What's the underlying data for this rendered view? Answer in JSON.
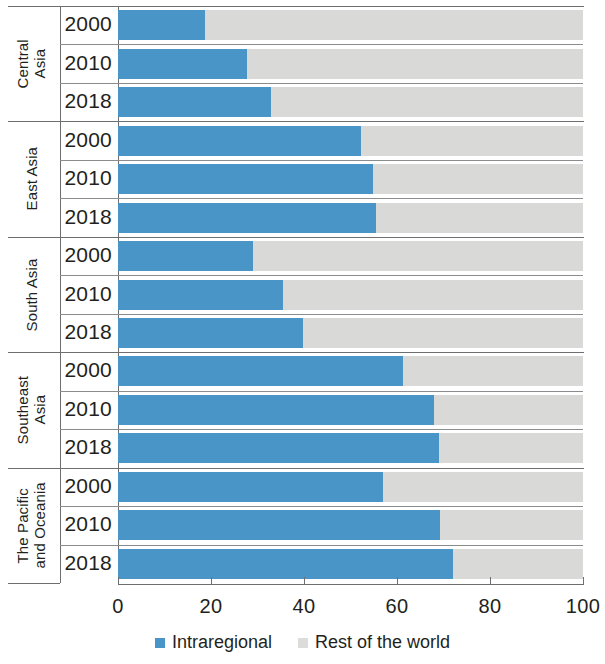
{
  "chart_data": {
    "type": "bar",
    "orientation": "horizontal",
    "stacked": true,
    "title": "",
    "xlabel": "",
    "ylabel": "",
    "xlim": [
      0,
      100
    ],
    "xticks": [
      0,
      20,
      40,
      60,
      80,
      100
    ],
    "xtick_labels": [
      "0",
      "20",
      "40",
      "60",
      "80",
      "100"
    ],
    "grid": false,
    "legend_position": "bottom-center",
    "legend": [
      "Intraregional",
      "Rest of the world"
    ],
    "colors": {
      "intraregional": "#4a95c8",
      "rest_of_the_world": "#d9d9d7",
      "axis": "#6d6e70",
      "text": "#231f20"
    },
    "series": [
      {
        "name": "Intraregional",
        "color": "#4a95c8"
      },
      {
        "name": "Rest of the world",
        "color": "#d9d9d7"
      }
    ],
    "groups": [
      {
        "label": "Central\nAsia",
        "label_plain": "Central Asia",
        "rows": [
          {
            "year": "2000",
            "intraregional": 18.7,
            "rest_of_the_world": 81.3
          },
          {
            "year": "2010",
            "intraregional": 27.7,
            "rest_of_the_world": 72.3
          },
          {
            "year": "2018",
            "intraregional": 32.9,
            "rest_of_the_world": 67.1
          }
        ]
      },
      {
        "label": "East Asia",
        "label_plain": "East Asia",
        "rows": [
          {
            "year": "2000",
            "intraregional": 52.3,
            "rest_of_the_world": 47.7
          },
          {
            "year": "2010",
            "intraregional": 54.8,
            "rest_of_the_world": 45.2
          },
          {
            "year": "2018",
            "intraregional": 55.5,
            "rest_of_the_world": 44.5
          }
        ]
      },
      {
        "label": "South Asia",
        "label_plain": "South Asia",
        "rows": [
          {
            "year": "2000",
            "intraregional": 29.0,
            "rest_of_the_world": 71.0
          },
          {
            "year": "2010",
            "intraregional": 35.5,
            "rest_of_the_world": 64.5
          },
          {
            "year": "2018",
            "intraregional": 39.8,
            "rest_of_the_world": 60.2
          }
        ]
      },
      {
        "label": "Southeast\nAsia",
        "label_plain": "Southeast Asia",
        "rows": [
          {
            "year": "2000",
            "intraregional": 61.3,
            "rest_of_the_world": 38.7
          },
          {
            "year": "2010",
            "intraregional": 68.0,
            "rest_of_the_world": 32.0
          },
          {
            "year": "2018",
            "intraregional": 69.0,
            "rest_of_the_world": 31.0
          }
        ]
      },
      {
        "label": "The Pacific\nand Oceania",
        "label_plain": "The Pacific and Oceania",
        "rows": [
          {
            "year": "2000",
            "intraregional": 57.0,
            "rest_of_the_world": 43.0
          },
          {
            "year": "2010",
            "intraregional": 69.2,
            "rest_of_the_world": 30.8
          },
          {
            "year": "2018",
            "intraregional": 72.0,
            "rest_of_the_world": 28.0
          }
        ]
      }
    ]
  }
}
